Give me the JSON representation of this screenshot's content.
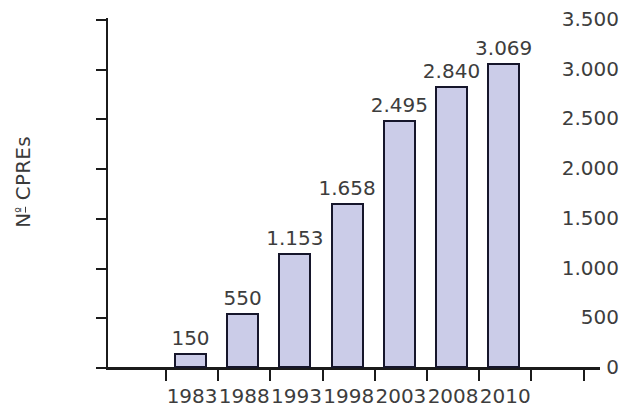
{
  "chart_data": {
    "type": "bar",
    "title": "",
    "subtitle": "",
    "xlabel": "",
    "ylabel": "Nº CPREs",
    "categories": [
      "1983",
      "1988",
      "1993",
      "1998",
      "2003",
      "2008",
      "2010"
    ],
    "values": [
      150,
      550,
      1153,
      1658,
      2495,
      2840,
      3069
    ],
    "data_labels": [
      "150",
      "550",
      "1.153",
      "1.658",
      "2.495",
      "2.840",
      "3.069"
    ],
    "ylim": [
      0,
      3500
    ],
    "y_ticks": [
      0,
      500,
      1000,
      1500,
      2000,
      2500,
      3000,
      3500
    ],
    "y_tick_labels": [
      "0",
      "500",
      "1.000",
      "1.500",
      "2.000",
      "2.500",
      "3.000",
      "3.500"
    ],
    "grid": false,
    "legend": false,
    "legend_position": "none",
    "number_format": "european-dot-thousands",
    "series": [
      {
        "name": "Nº CPREs",
        "values": [
          150,
          550,
          1153,
          1658,
          2495,
          2840,
          3069
        ]
      }
    ]
  },
  "style": {
    "bar_fill": "#cbcce8",
    "bar_stroke": "#16162b",
    "axis_color": "#1b1b1b",
    "text_color": "#3d3d3d",
    "background": "#ffffff"
  },
  "axis_title": {
    "prefix": "N",
    "ordinal": "º",
    "suffix": " CPREs"
  }
}
